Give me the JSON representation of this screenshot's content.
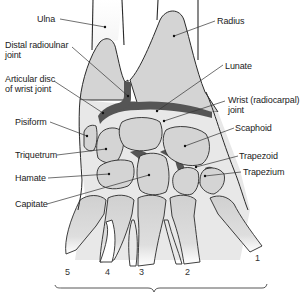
{
  "diagram": {
    "labels_left": [
      {
        "id": "ulna",
        "text": "Ulna"
      },
      {
        "id": "distal-radioulnar-joint",
        "line1": "Distal radioulnar",
        "line2": "joint"
      },
      {
        "id": "articular-disc",
        "line1": "Articular disc",
        "line2": "of wrist joint"
      },
      {
        "id": "pisiform",
        "text": "Pisiform"
      },
      {
        "id": "triquetrum",
        "text": "Triquetrum"
      },
      {
        "id": "hamate",
        "text": "Hamate"
      },
      {
        "id": "capitate",
        "text": "Capitate"
      }
    ],
    "labels_right": [
      {
        "id": "radius",
        "text": "Radius"
      },
      {
        "id": "lunate",
        "text": "Lunate"
      },
      {
        "id": "wrist-joint",
        "line1": "Wrist (radiocarpal)",
        "line2": "joint"
      },
      {
        "id": "scaphoid",
        "text": "Scaphoid"
      },
      {
        "id": "trapezoid",
        "text": "Trapezoid"
      },
      {
        "id": "trapezium",
        "text": "Trapezium"
      }
    ],
    "metacarpal_numbers": [
      "5",
      "4",
      "3",
      "2",
      "1"
    ],
    "colors": {
      "bone_fill": "#d4d4d4",
      "joint_dark": "#555555",
      "outline": "#2a2a2a",
      "background": "#ffffff"
    }
  }
}
